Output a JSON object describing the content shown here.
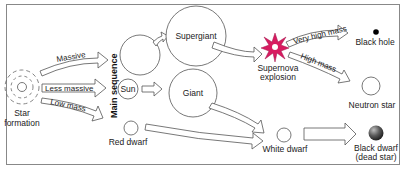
{
  "diagram": {
    "nodes": {
      "star_formation": {
        "label_line1": "Star",
        "label_line2": "formation"
      },
      "main_sequence": {
        "label": "Main sequence"
      },
      "massive_star": {
        "label": ""
      },
      "sun": {
        "label": "Sun"
      },
      "red_dwarf": {
        "label": "Red dwarf"
      },
      "supergiant": {
        "label": "Supergiant"
      },
      "giant": {
        "label": "Giant"
      },
      "supernova": {
        "label_line1": "Supernova",
        "label_line2": "explosion"
      },
      "black_hole": {
        "label": "Black hole"
      },
      "neutron_star": {
        "label": "Neutron star"
      },
      "white_dwarf": {
        "label": "White dwarf"
      },
      "black_dwarf": {
        "label_line1": "Black dwarf",
        "label_line2": "(dead star)"
      }
    },
    "edges": {
      "massive": {
        "label": "Massive"
      },
      "less_massive": {
        "label": "Less massive"
      },
      "low_mass": {
        "label": "Low mass"
      },
      "very_high_mass": {
        "label": "Very high mass"
      },
      "high_mass": {
        "label": "High mass"
      }
    },
    "colors": {
      "supernova": "#d81b60",
      "supernova_core": "#ffffff",
      "black_hole": "#000000",
      "black_dwarf": "#4a4a4a",
      "border": "#888888"
    }
  }
}
